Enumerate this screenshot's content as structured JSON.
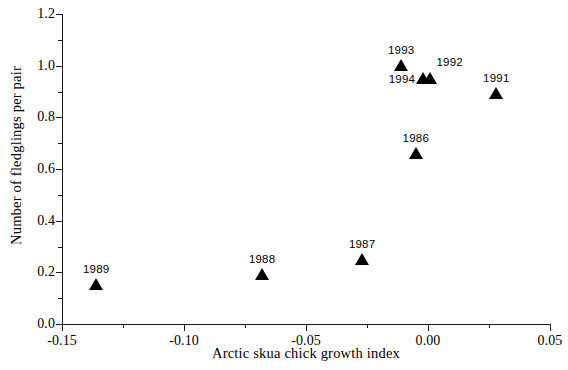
{
  "chart_data": {
    "type": "scatter",
    "title": "",
    "xlabel": "Arctic skua chick growth index",
    "ylabel": "Number of fledglings per pair",
    "xlim": [
      -0.15,
      0.05
    ],
    "ylim": [
      0.0,
      1.2
    ],
    "grid": false,
    "legend": "none",
    "x_ticks": [
      {
        "value": -0.15,
        "label": "-0.15",
        "major": true
      },
      {
        "value": -0.125,
        "label": "",
        "major": false
      },
      {
        "value": -0.1,
        "label": "-0.10",
        "major": true
      },
      {
        "value": -0.075,
        "label": "",
        "major": false
      },
      {
        "value": -0.05,
        "label": "-0.05",
        "major": true
      },
      {
        "value": -0.025,
        "label": "",
        "major": false
      },
      {
        "value": 0.0,
        "label": "0.00",
        "major": true
      },
      {
        "value": 0.025,
        "label": "",
        "major": false
      },
      {
        "value": 0.05,
        "label": "0.05",
        "major": true
      }
    ],
    "y_ticks": [
      {
        "value": 0.0,
        "label": "0.0",
        "major": true
      },
      {
        "value": 0.1,
        "label": "",
        "major": false
      },
      {
        "value": 0.2,
        "label": "0.2",
        "major": true
      },
      {
        "value": 0.3,
        "label": "",
        "major": false
      },
      {
        "value": 0.4,
        "label": "0.4",
        "major": true
      },
      {
        "value": 0.5,
        "label": "",
        "major": false
      },
      {
        "value": 0.6,
        "label": "0.6",
        "major": true
      },
      {
        "value": 0.7,
        "label": "",
        "major": false
      },
      {
        "value": 0.8,
        "label": "0.8",
        "major": true
      },
      {
        "value": 0.9,
        "label": "",
        "major": false
      },
      {
        "value": 1.0,
        "label": "1.0",
        "major": true
      },
      {
        "value": 1.1,
        "label": "",
        "major": false
      },
      {
        "value": 1.2,
        "label": "1.2",
        "major": true
      }
    ],
    "marker": "triangle-up",
    "marker_color": "#000000",
    "points": [
      {
        "label": "1989",
        "x": -0.136,
        "y": 0.13,
        "label_pos": "above"
      },
      {
        "label": "1988",
        "x": -0.068,
        "y": 0.17,
        "label_pos": "above"
      },
      {
        "label": "1987",
        "x": -0.027,
        "y": 0.23,
        "label_pos": "above"
      },
      {
        "label": "1986",
        "x": -0.005,
        "y": 0.64,
        "label_pos": "above"
      },
      {
        "label": "1993",
        "x": -0.011,
        "y": 0.98,
        "label_pos": "above"
      },
      {
        "label": "1994",
        "x": -0.002,
        "y": 0.93,
        "label_pos": "left"
      },
      {
        "label": "1992",
        "x": 0.001,
        "y": 0.93,
        "label_pos": "above-right"
      },
      {
        "label": "1991",
        "x": 0.028,
        "y": 0.87,
        "label_pos": "above"
      }
    ]
  }
}
